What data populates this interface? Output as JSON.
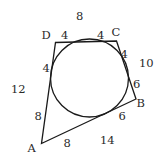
{
  "figure": {
    "vertices": {
      "A": "A",
      "B": "B",
      "C": "C",
      "D": "D"
    },
    "side_totals": {
      "DC": "8",
      "CB": "10",
      "BA": "14",
      "AD": "12"
    },
    "tangent_segments": {
      "D_on_DC": "4",
      "C_on_DC": "4",
      "C_on_CB": "4",
      "B_on_CB": "6",
      "B_on_BA": "6",
      "A_on_BA": "8",
      "A_on_AD": "8",
      "D_on_AD": "4"
    },
    "stroke_color": "#1a1a1a",
    "text_color": "#2a2a2a"
  }
}
